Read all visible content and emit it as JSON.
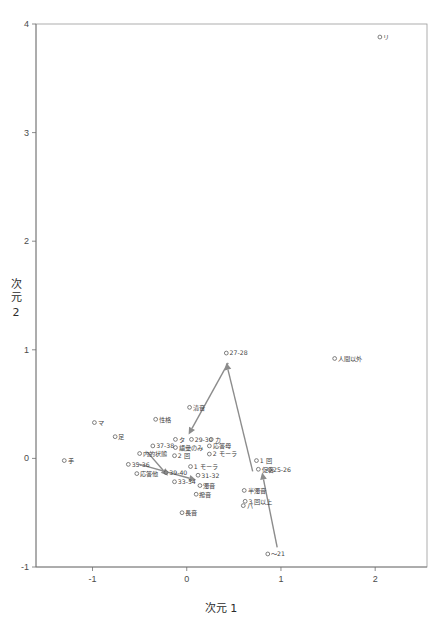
{
  "chart_data": {
    "type": "scatter",
    "title": "",
    "xlabel": "次元 1",
    "ylabel": "次元 2",
    "xlim": [
      -1.6,
      2.55
    ],
    "ylim": [
      -1.0,
      4.0
    ],
    "xticks": [
      -1,
      0,
      1,
      2
    ],
    "yticks": [
      -1,
      0,
      1,
      2,
      3,
      4
    ],
    "xticklabels": [
      "-1",
      "0",
      "1",
      "2"
    ],
    "yticklabels": [
      "-1",
      "0",
      "1",
      "2",
      "3",
      "4"
    ],
    "grid": false,
    "legend": "none",
    "marker": "open-circle",
    "points": [
      {
        "label": "リ",
        "x": 2.05,
        "y": 3.88,
        "anchor": "start"
      },
      {
        "label": "人間以外",
        "x": 1.57,
        "y": 0.92,
        "anchor": "start"
      },
      {
        "label": "27-28",
        "x": 0.42,
        "y": 0.97,
        "anchor": "start"
      },
      {
        "label": "清音",
        "x": 0.03,
        "y": 0.47,
        "anchor": "start"
      },
      {
        "label": "性格",
        "x": -0.33,
        "y": 0.36,
        "anchor": "start"
      },
      {
        "label": "マ",
        "x": -0.98,
        "y": 0.33,
        "anchor": "start"
      },
      {
        "label": "足",
        "x": -0.76,
        "y": 0.2,
        "anchor": "start"
      },
      {
        "label": "タ",
        "x": -0.12,
        "y": 0.175,
        "anchor": "start"
      },
      {
        "label": "29-30",
        "x": 0.05,
        "y": 0.175,
        "anchor": "start"
      },
      {
        "label": "カ",
        "x": 0.26,
        "y": 0.175,
        "anchor": "start"
      },
      {
        "label": "応答母",
        "x": 0.24,
        "y": 0.115,
        "anchor": "start"
      },
      {
        "label": "語彙のみ",
        "x": -0.12,
        "y": 0.1,
        "anchor": "start"
      },
      {
        "label": "37-38",
        "x": -0.36,
        "y": 0.115,
        "anchor": "start"
      },
      {
        "label": "内的状態",
        "x": -0.5,
        "y": 0.045,
        "anchor": "start"
      },
      {
        "label": "2 モーラ",
        "x": 0.24,
        "y": 0.04,
        "anchor": "start"
      },
      {
        "label": "2 回",
        "x": -0.13,
        "y": 0.025,
        "anchor": "start"
      },
      {
        "label": "手",
        "x": -1.3,
        "y": -0.02,
        "anchor": "start"
      },
      {
        "label": "1 回",
        "x": 0.74,
        "y": -0.02,
        "anchor": "start"
      },
      {
        "label": "35-36",
        "x": -0.62,
        "y": -0.055,
        "anchor": "start"
      },
      {
        "label": "1 モーラ",
        "x": 0.04,
        "y": -0.075,
        "anchor": "start"
      },
      {
        "label": "25-26",
        "x": 0.88,
        "y": -0.105,
        "anchor": "start"
      },
      {
        "label": "促音",
        "x": 0.76,
        "y": -0.1,
        "anchor": "start"
      },
      {
        "label": "応答他",
        "x": -0.53,
        "y": -0.14,
        "anchor": "start"
      },
      {
        "label": "39-40",
        "x": -0.22,
        "y": -0.13,
        "anchor": "start"
      },
      {
        "label": "31-32",
        "x": 0.12,
        "y": -0.155,
        "anchor": "start"
      },
      {
        "label": "33-34",
        "x": -0.13,
        "y": -0.215,
        "anchor": "start"
      },
      {
        "label": "濁音",
        "x": 0.14,
        "y": -0.25,
        "anchor": "start"
      },
      {
        "label": "半濁音",
        "x": 0.61,
        "y": -0.295,
        "anchor": "start"
      },
      {
        "label": "撥音",
        "x": 0.1,
        "y": -0.33,
        "anchor": "start"
      },
      {
        "label": "3 回以上",
        "x": 0.62,
        "y": -0.395,
        "anchor": "start"
      },
      {
        "label": "パ",
        "x": 0.6,
        "y": -0.435,
        "anchor": "start"
      },
      {
        "label": "長音",
        "x": -0.05,
        "y": -0.5,
        "anchor": "start"
      },
      {
        "label": "～21",
        "x": 0.86,
        "y": -0.88,
        "anchor": "start"
      }
    ],
    "arrows": [
      {
        "name": "arrow-to-cluster",
        "x1": 0.44,
        "y1": 0.88,
        "x2": 0.02,
        "y2": 0.22
      },
      {
        "name": "arrow-to-27-28",
        "x1": 0.7,
        "y1": -0.12,
        "x2": 0.42,
        "y2": 0.88
      },
      {
        "name": "arrow-to-25-26",
        "x1": 0.96,
        "y1": -0.82,
        "x2": 0.8,
        "y2": -0.13
      },
      {
        "name": "arrow-to-31-32",
        "x1": -0.52,
        "y1": -0.05,
        "x2": 0.1,
        "y2": -0.2
      },
      {
        "name": "arrow-to-39-40-down",
        "x1": -0.42,
        "y1": 0.06,
        "x2": -0.2,
        "y2": -0.16
      }
    ]
  }
}
